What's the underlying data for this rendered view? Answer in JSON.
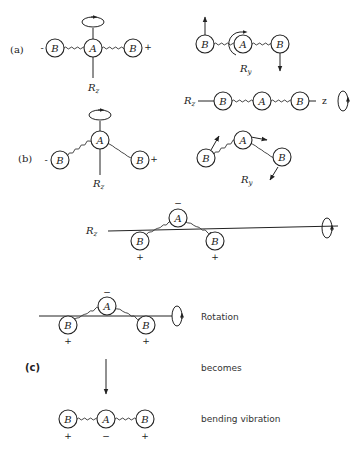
{
  "figure": {
    "parts": [
      {
        "label": "(a)"
      },
      {
        "label": "(b)"
      },
      {
        "label": "(c)"
      }
    ],
    "atoms": {
      "central": "A",
      "terminal": "B"
    },
    "signs": {
      "plus": "+",
      "minus": "−",
      "minus_short": "-"
    },
    "rotations": {
      "rz_main": "R",
      "rz_sub": "z",
      "ry_main": "R",
      "ry_sub": "y",
      "axis_label": "z"
    },
    "annotations": {
      "rotation": "Rotation",
      "becomes": "becomes",
      "bending": "bending vibration"
    }
  }
}
